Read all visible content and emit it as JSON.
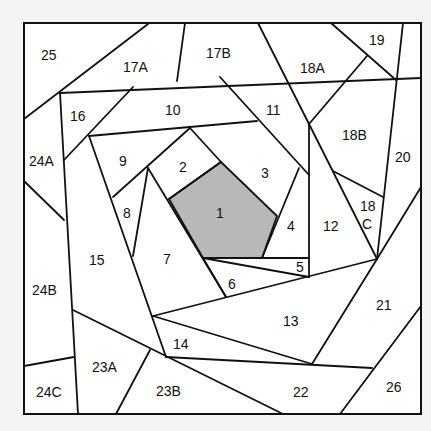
{
  "diagram": {
    "type": "foundation-paper-piecing-pattern",
    "background": "#f4f4f4",
    "fill": "#ffffff",
    "stroke": "#111111",
    "highlight_fill": "#b8b8b8",
    "highlighted_piece": "1",
    "labels": {
      "p1": "1",
      "p2": "2",
      "p3": "3",
      "p4": "4",
      "p5": "5",
      "p6": "6",
      "p7": "7",
      "p8": "8",
      "p9": "9",
      "p10": "10",
      "p11": "11",
      "p12": "12",
      "p13": "13",
      "p14": "14",
      "p15": "15",
      "p16": "16",
      "p17a": "17A",
      "p17b": "17B",
      "p18a": "18A",
      "p18b": "18B",
      "p18c_top": "18",
      "p18c_bottom": "C",
      "p19": "19",
      "p20": "20",
      "p21": "21",
      "p22": "22",
      "p23a": "23A",
      "p23b": "23B",
      "p24a": "24A",
      "p24b": "24B",
      "p24c": "24C",
      "p25": "25",
      "p26": "26"
    }
  }
}
